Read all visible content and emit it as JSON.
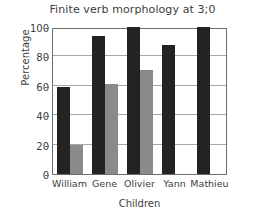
{
  "chart_data": {
    "type": "bar",
    "title": "Finite verb morphology at 3;0",
    "xlabel": "Children",
    "ylabel": "Percentage",
    "categories": [
      "William",
      "Gene",
      "Olivier",
      "Yann",
      "Mathieu"
    ],
    "series": [
      {
        "name": "dark",
        "color": "#232323",
        "values": [
          59,
          94,
          100,
          88,
          100
        ]
      },
      {
        "name": "grey",
        "color": "#8a8a8a",
        "values": [
          20,
          61,
          71,
          null,
          null
        ]
      }
    ],
    "ylim": [
      0,
      100
    ],
    "yticks": [
      0,
      20,
      40,
      60,
      80,
      100
    ],
    "ytick_labels": [
      "0",
      "20",
      "40",
      "60",
      "80",
      "100"
    ],
    "grid": "horizontal",
    "legend": "none"
  }
}
